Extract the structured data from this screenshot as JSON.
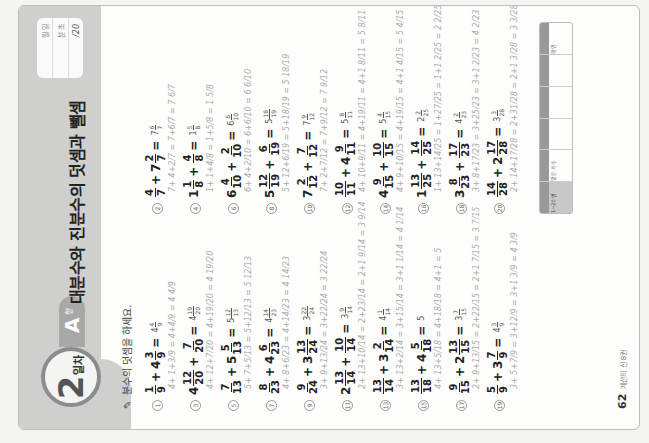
{
  "header": {
    "day_number": "2",
    "day_suffix": "일차",
    "level_letter": "A",
    "level_suffix": "형",
    "title": "대분수와 진분수의 덧셈과 뺄셈",
    "record": {
      "date": "월   일",
      "time": "분   초",
      "score": "/20"
    }
  },
  "instruction": "분수의 덧셈을 하세요.",
  "problems_left": [
    {
      "no": "1",
      "a_whole": "",
      "a_n": "1",
      "a_d": "9",
      "b_whole": "4",
      "b_n": "3",
      "b_d": "9",
      "ans_whole": "4",
      "ans_n": "4",
      "ans_d": "9",
      "work": "4+ 1+3/9 = 4+4/9 = 4 4/9"
    },
    {
      "no": "3",
      "a_whole": "4",
      "a_n": "12",
      "a_d": "20",
      "b_whole": "",
      "b_n": "7",
      "b_d": "20",
      "ans_whole": "4",
      "ans_n": "19",
      "ans_d": "20",
      "work": "4+ 12+7/20 = 4+19/20 = 4 19/20"
    },
    {
      "no": "5",
      "a_whole": "",
      "a_n": "7",
      "a_d": "13",
      "b_whole": "5",
      "b_n": "5",
      "b_d": "13",
      "ans_whole": "5",
      "ans_n": "12",
      "ans_d": "13",
      "work": "5+ 7+5/13 = 5+12/13 = 5 12/13"
    },
    {
      "no": "7",
      "a_whole": "",
      "a_n": "8",
      "a_d": "23",
      "b_whole": "4",
      "b_n": "6",
      "b_d": "23",
      "ans_whole": "4",
      "ans_n": "14",
      "ans_d": "23",
      "work": "4+ 8+6/23 = 4+14/23 = 4 14/23"
    },
    {
      "no": "9",
      "a_whole": "",
      "a_n": "9",
      "a_d": "24",
      "b_whole": "3",
      "b_n": "13",
      "b_d": "24",
      "ans_whole": "3",
      "ans_n": "22",
      "ans_d": "24",
      "work": "3+ 9+13/24 = 3+22/24 = 3 22/24"
    },
    {
      "no": "11",
      "a_whole": "2",
      "a_n": "13",
      "a_d": "14",
      "b_whole": "",
      "b_n": "10",
      "b_d": "14",
      "ans_whole": "3",
      "ans_n": "9",
      "ans_d": "14",
      "work": "2+ 13+10/14 = 2+23/14 = 2+1 9/14 = 3 9/14"
    },
    {
      "no": "13",
      "a_whole": "",
      "a_n": "13",
      "a_d": "14",
      "b_whole": "3",
      "b_n": "2",
      "b_d": "14",
      "ans_whole": "4",
      "ans_n": "1",
      "ans_d": "14",
      "work": "3+ 13+2/14 = 3+15/14 = 3+1 1/14 = 4 1/14"
    },
    {
      "no": "15",
      "a_whole": "",
      "a_n": "13",
      "a_d": "18",
      "b_whole": "4",
      "b_n": "5",
      "b_d": "18",
      "ans_whole": "5",
      "ans_n": "",
      "ans_d": "",
      "work": "4+ 13+5/18 = 4+18/18 = 4+1 = 5"
    },
    {
      "no": "17",
      "a_whole": "",
      "a_n": "9",
      "a_d": "15",
      "b_whole": "2",
      "b_n": "13",
      "b_d": "15",
      "ans_whole": "3",
      "ans_n": "7",
      "ans_d": "15",
      "work": "2+ 9+13/15 = 2+22/15 = 2+1 7/15 = 3 7/15"
    },
    {
      "no": "19",
      "a_whole": "",
      "a_n": "5",
      "a_d": "9",
      "b_whole": "3",
      "b_n": "7",
      "b_d": "9",
      "ans_whole": "4",
      "ans_n": "3",
      "ans_d": "9",
      "work": "3+ 5+7/9 = 3+12/9 = 3+1 3/9 = 4 3/9"
    }
  ],
  "problems_right": [
    {
      "no": "2",
      "a_whole": "",
      "a_n": "4",
      "a_d": "7",
      "b_whole": "7",
      "b_n": "2",
      "b_d": "7",
      "ans_whole": "7",
      "ans_n": "6",
      "ans_d": "7",
      "work": "7+ 4+2/7 = 7+6/7 = 7 6/7"
    },
    {
      "no": "4",
      "a_whole": "1",
      "a_n": "1",
      "a_d": "8",
      "b_whole": "",
      "b_n": "4",
      "b_d": "8",
      "ans_whole": "1",
      "ans_n": "5",
      "ans_d": "8",
      "work": "1+ 1+4/8 = 1+5/8 = 1 5/8"
    },
    {
      "no": "6",
      "a_whole": "6",
      "a_n": "4",
      "a_d": "10",
      "b_whole": "",
      "b_n": "2",
      "b_d": "10",
      "ans_whole": "6",
      "ans_n": "6",
      "ans_d": "10",
      "work": "6+ 4+2/10 = 6+6/10 = 6 6/10"
    },
    {
      "no": "8",
      "a_whole": "5",
      "a_n": "12",
      "a_d": "19",
      "b_whole": "",
      "b_n": "6",
      "b_d": "19",
      "ans_whole": "5",
      "ans_n": "18",
      "ans_d": "19",
      "work": "5+ 12+6/19 = 5+18/19 = 5 18/19"
    },
    {
      "no": "10",
      "a_whole": "7",
      "a_n": "2",
      "a_d": "12",
      "b_whole": "",
      "b_n": "7",
      "b_d": "12",
      "ans_whole": "7",
      "ans_n": "9",
      "ans_d": "12",
      "work": "7+ 2+7/12 = 7+9/12 = 7 9/12"
    },
    {
      "no": "12",
      "a_whole": "",
      "a_n": "10",
      "a_d": "11",
      "b_whole": "4",
      "b_n": "9",
      "b_d": "11",
      "ans_whole": "5",
      "ans_n": "8",
      "ans_d": "11",
      "work": "4+ 10+9/11 = 4+19/11 = 4+1 8/11 = 5 8/11"
    },
    {
      "no": "14",
      "a_whole": "4",
      "a_n": "9",
      "a_d": "15",
      "b_whole": "",
      "b_n": "10",
      "b_d": "15",
      "ans_whole": "5",
      "ans_n": "4",
      "ans_d": "15",
      "work": "4+ 9+10/15 = 4+19/15 = 4+1 4/15 = 5 4/15"
    },
    {
      "no": "16",
      "a_whole": "1",
      "a_n": "13",
      "a_d": "25",
      "b_whole": "",
      "b_n": "14",
      "b_d": "25",
      "ans_whole": "2",
      "ans_n": "2",
      "ans_d": "25",
      "work": "1+ 13+14/25 = 1+27/25 = 1+1 2/25 = 2 2/25"
    },
    {
      "no": "18",
      "a_whole": "3",
      "a_n": "8",
      "a_d": "23",
      "b_whole": "",
      "b_n": "17",
      "b_d": "23",
      "ans_whole": "4",
      "ans_n": "2",
      "ans_d": "23",
      "work": "3+ 8+17/23 = 3+25/23 = 3+1 2/23 = 4 2/23"
    },
    {
      "no": "20",
      "a_whole": "",
      "a_n": "14",
      "a_d": "28",
      "b_whole": "2",
      "b_n": "17",
      "b_d": "28",
      "ans_whole": "3",
      "ans_n": "3",
      "ans_d": "28",
      "work": "2+ 14+17/28 = 2+31/28 = 2+1 3/28 = 3 3/28"
    }
  ],
  "answer_table": {
    "cells": [
      "1~20 번",
      "맞은 개수",
      "",
      "",
      "",
      "확인"
    ]
  },
  "footer": {
    "page_number": "62",
    "book_name": "계산의 신 8권"
  }
}
